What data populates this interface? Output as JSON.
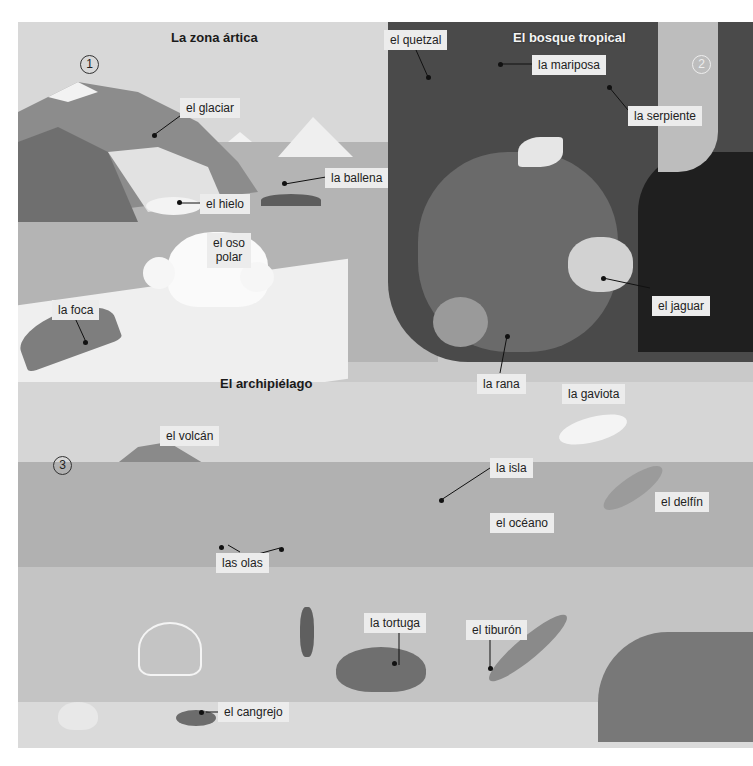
{
  "headings": {
    "arctic": "La zona ártica",
    "rainforest": "El bosque tropical",
    "archipelago": "El archipiélago"
  },
  "section_numbers": [
    "1",
    "2",
    "3"
  ],
  "labels": {
    "glacier": "el glaciar",
    "whale": "la ballena",
    "ice": "el hielo",
    "polar_bear_1": "el oso",
    "polar_bear_2": "polar",
    "seal": "la foca",
    "quetzal": "el quetzal",
    "butterfly": "la mariposa",
    "snake": "la serpiente",
    "jaguar": "el jaguar",
    "frog": "la rana",
    "seagull": "la gaviota",
    "volcano": "el volcán",
    "island": "la isla",
    "dolphin": "el delfín",
    "ocean": "el océano",
    "waves": "las olas",
    "turtle": "la tortuga",
    "shark": "el tiburón",
    "crab": "el cangrejo"
  }
}
